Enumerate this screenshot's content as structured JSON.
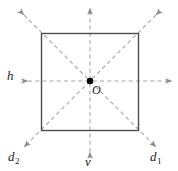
{
  "figure": {
    "type": "geometry-diagram",
    "colors": {
      "background": "#ffffff",
      "square_stroke": "#4d4d4d",
      "axis_stroke": "#a6a6a6",
      "arrow_fill": "#8c8c8c",
      "point_fill": "#000000",
      "label_color": "#1a1a1a"
    },
    "square": {
      "name": "square",
      "x": 41,
      "y": 33,
      "width": 98,
      "height": 98,
      "stroke_width": 1.4
    },
    "center_point": {
      "name": "center-point-O",
      "cx": 90,
      "cy": 81,
      "r": 3.2,
      "label": "O"
    },
    "axes": [
      {
        "id": "h",
        "label": "h",
        "subscript": "",
        "kind": "horizontal",
        "x1": 26,
        "y1": 81,
        "x2": 174,
        "y2": 81
      },
      {
        "id": "v",
        "label": "v",
        "subscript": "",
        "kind": "vertical",
        "x1": 90,
        "y1": 6,
        "x2": 90,
        "y2": 154
      },
      {
        "id": "d1",
        "label": "d",
        "subscript": "1",
        "kind": "diagonal-nw-se",
        "x1": 22,
        "y1": 13,
        "x2": 158,
        "y2": 149
      },
      {
        "id": "d2",
        "label": "d",
        "subscript": "2",
        "kind": "diagonal-ne-sw",
        "x1": 158,
        "y1": 13,
        "x2": 22,
        "y2": 149
      }
    ],
    "labels": {
      "h": "h",
      "v": "v",
      "d1": "d",
      "d1_sub": "1",
      "d2": "d",
      "d2_sub": "2",
      "origin": "O"
    }
  }
}
